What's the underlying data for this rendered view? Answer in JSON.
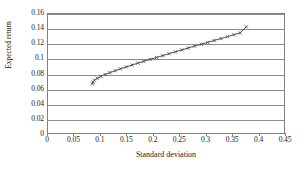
{
  "chart_data": {
    "type": "line",
    "title": "",
    "xlabel": "Standard deviation",
    "ylabel": "Expected return",
    "xlim": [
      0,
      0.45
    ],
    "ylim": [
      0,
      0.16
    ],
    "xticks": [
      "0",
      "0.05",
      "0.1",
      "0.15",
      "0.2",
      "0.25",
      "0.3",
      "0.35",
      "0.4",
      "0.45"
    ],
    "xtick_values": [
      0,
      0.05,
      0.1,
      0.15,
      0.2,
      0.25,
      0.3,
      0.35,
      0.4,
      0.45
    ],
    "yticks": [
      "0",
      "0.02",
      "0.04",
      "0.06",
      "0.08",
      "0.1",
      "0.12",
      "0.14",
      "0.16"
    ],
    "ytick_values": [
      0,
      0.02,
      0.04,
      0.06,
      0.08,
      0.1,
      0.12,
      0.14,
      0.16
    ],
    "grid": "horizontal",
    "legend": "none",
    "marker": "small-cross",
    "line_color": "#555555",
    "series": [
      {
        "name": "Efficient frontier",
        "x": [
          0.084,
          0.085,
          0.088,
          0.093,
          0.1,
          0.108,
          0.117,
          0.127,
          0.137,
          0.148,
          0.159,
          0.17,
          0.181,
          0.193,
          0.205,
          0.217,
          0.229,
          0.241,
          0.253,
          0.265,
          0.277,
          0.29,
          0.302,
          0.314,
          0.327,
          0.339,
          0.351,
          0.363,
          0.375
        ],
        "y": [
          0.0675,
          0.07,
          0.0725,
          0.075,
          0.0775,
          0.08,
          0.0825,
          0.085,
          0.0875,
          0.09,
          0.0925,
          0.095,
          0.0975,
          0.1,
          0.1025,
          0.105,
          0.1075,
          0.11,
          0.1125,
          0.115,
          0.1175,
          0.12,
          0.1225,
          0.125,
          0.1275,
          0.13,
          0.1325,
          0.135,
          0.143
        ]
      }
    ]
  }
}
